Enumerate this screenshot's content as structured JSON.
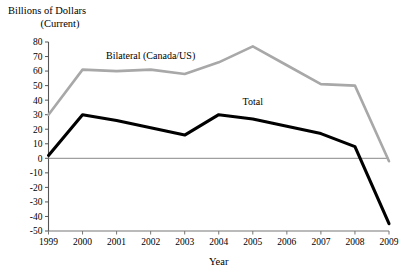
{
  "title": {
    "line1": "Billions of Dollars",
    "line2": "(Current)"
  },
  "chart_data": {
    "type": "line",
    "title": "Billions of Dollars (Current)",
    "xlabel": "Year",
    "ylabel": "Billions of Dollars (Current)",
    "categories": [
      "1999",
      "2000",
      "2001",
      "2002",
      "2003",
      "2004",
      "2005",
      "2006",
      "2007",
      "2008",
      "2009"
    ],
    "x": [
      1999,
      2000,
      2001,
      2002,
      2003,
      2004,
      2005,
      2006,
      2007,
      2008,
      2009
    ],
    "xlim": [
      1999,
      2009
    ],
    "ylim": [
      -50,
      80
    ],
    "yticks": [
      80,
      70,
      60,
      50,
      40,
      30,
      20,
      10,
      0,
      -10,
      -20,
      -30,
      -40,
      -50
    ],
    "ytick_labels": [
      "80",
      "70",
      "60",
      "50",
      "40",
      "30",
      "20",
      "10",
      "0",
      "-10",
      "-20",
      "-30",
      "-40",
      "-50"
    ],
    "grid": false,
    "legend": "inline-annotations",
    "zero_line": 0,
    "series": [
      {
        "name": "Bilateral (Canada/US)",
        "color": "#a8a8a8",
        "width": 2.6,
        "label_x": 2002,
        "label_y": 68,
        "values": [
          30,
          61,
          60,
          61,
          58,
          66,
          77,
          64,
          51,
          50,
          -2
        ]
      },
      {
        "name": "Total",
        "color": "#000000",
        "width": 3.1,
        "label_x": 2005,
        "label_y": 37,
        "values": [
          2,
          30,
          26,
          21,
          16,
          30,
          27,
          22,
          17,
          8,
          -45
        ]
      }
    ]
  }
}
